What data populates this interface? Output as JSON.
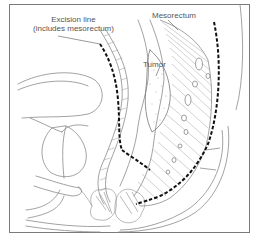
{
  "figure": {
    "type": "anatomical illustration",
    "labels": {
      "excision_line_1": "Excision line",
      "excision_line_2": "(includes mesorectum)",
      "mesorectum": "Mesorectum",
      "tumor": "Tumor"
    },
    "colors": {
      "line": "#8a8a8a",
      "dark_line": "#555555",
      "dashed_excision": "#111111",
      "frame": "#7a7a7a",
      "background": "#ffffff"
    }
  }
}
